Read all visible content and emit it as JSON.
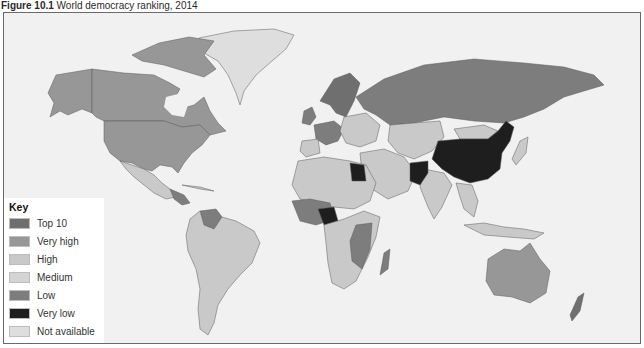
{
  "figure": {
    "label": "Figure 10.1",
    "title": "World democracy ranking, 2014"
  },
  "legend": {
    "title": "Key",
    "items": [
      {
        "label": "Top 10",
        "color": "#6f6f6f"
      },
      {
        "label": "Very high",
        "color": "#979797"
      },
      {
        "label": "High",
        "color": "#c9c9c9"
      },
      {
        "label": "Medium",
        "color": "#d4d4d4"
      },
      {
        "label": "Low",
        "color": "#7d7d7d"
      },
      {
        "label": "Very low",
        "color": "#1e1e1e"
      },
      {
        "label": "Not available",
        "color": "#dedede"
      }
    ]
  },
  "colors": {
    "ocean": "#f1f1f1",
    "border": "#555555",
    "top10": "#6f6f6f",
    "very_high": "#979797",
    "high": "#c9c9c9",
    "medium": "#d4d4d4",
    "low": "#7d7d7d",
    "very_low": "#1e1e1e",
    "not_available": "#dedede"
  }
}
